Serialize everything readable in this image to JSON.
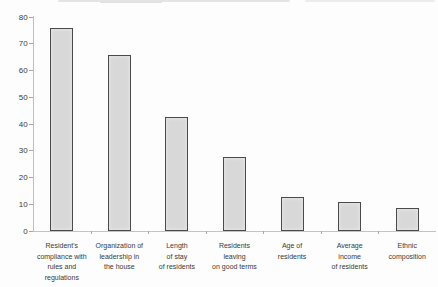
{
  "figure": {
    "background": "#fdfdfd",
    "note": "scanned bar chart figure, no title or legend visible"
  },
  "chart_data": {
    "type": "bar",
    "categories": [
      "Resident's\ncompliance with\nrules and\nregulations",
      "Organization of\nleadership in\nthe house",
      "Length\nof stay\nof residents",
      "Residents\nleaving\non good terms",
      "Age of\nresidents",
      "Average\nincome\nof residents",
      "Ethnic\ncomposition"
    ],
    "values": [
      75,
      65,
      42,
      27,
      12,
      10,
      8
    ],
    "title": "",
    "xlabel": "",
    "ylabel": "",
    "ylim": [
      0,
      80
    ],
    "yticks": [
      0,
      10,
      20,
      30,
      40,
      50,
      60,
      70,
      80
    ],
    "grid": false,
    "legend": false,
    "colors": {
      "bar_fill": "#d8d8d8",
      "bar_border": "#4a4a4a",
      "axis": "#c3c3c3",
      "tick": "#a8a8a8",
      "text": "#3c3c3c"
    }
  }
}
